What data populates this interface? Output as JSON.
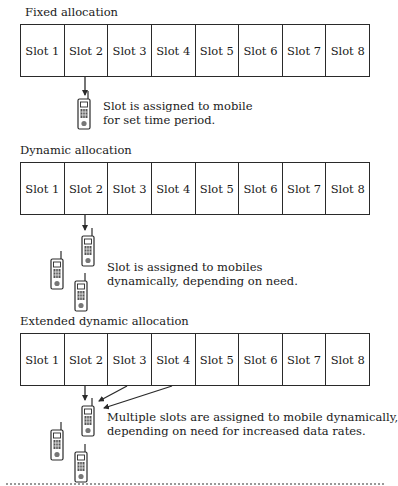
{
  "figure": {
    "sections": [
      {
        "id": "fixed",
        "title": "Fixed allocation",
        "slots": [
          "Slot 1",
          "Slot 2",
          "Slot 3",
          "Slot 4",
          "Slot 5",
          "Slot 6",
          "Slot 7",
          "Slot 8"
        ],
        "assigned_slots": [
          "Slot 2"
        ],
        "mobiles_shown": 1,
        "description": [
          "Slot is assigned to mobile",
          "for set time period."
        ]
      },
      {
        "id": "dynamic",
        "title": "Dynamic allocation",
        "slots": [
          "Slot 1",
          "Slot 2",
          "Slot 3",
          "Slot 4",
          "Slot 5",
          "Slot 6",
          "Slot 7",
          "Slot 8"
        ],
        "assigned_slots": [
          "Slot 2"
        ],
        "mobiles_shown": 3,
        "description": [
          "Slot is assigned to mobiles",
          "dynamically, depending on need."
        ]
      },
      {
        "id": "extended",
        "title": "Extended dynamic allocation",
        "slots": [
          "Slot 1",
          "Slot 2",
          "Slot 3",
          "Slot 4",
          "Slot 5",
          "Slot 6",
          "Slot 7",
          "Slot 8"
        ],
        "assigned_slots": [
          "Slot 2",
          "Slot 3",
          "Slot 4"
        ],
        "mobiles_shown": 3,
        "description": [
          "Multiple slots are assigned to mobile dynamically,",
          "depending on need for increased data rates."
        ]
      }
    ],
    "icons": {
      "mobile": "mobile-phone-icon",
      "arrow": "arrow-down-icon"
    },
    "colors": {
      "line": "#2a2a2a",
      "background": "#ffffff",
      "text": "#1a1a1a"
    }
  }
}
